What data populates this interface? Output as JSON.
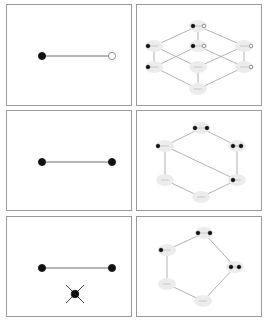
{
  "figure": {
    "rows": [
      {
        "left": {
          "label": "graph-edge-filled-open",
          "edge": {
            "x1": 35,
            "y1": 51,
            "x2": 105,
            "y2": 51
          },
          "nodes": [
            {
              "x": 35,
              "y": 51,
              "fill": "filled"
            },
            {
              "x": 105,
              "y": 51,
              "fill": "open"
            }
          ],
          "cross": null
        },
        "right": {
          "label": "lattice-8-nodes",
          "nodes": [
            {
              "id": "top",
              "x": 61,
              "y": 21,
              "dots": [
                {
                  "dx": -5,
                  "f": "filled"
                },
                {
                  "dx": 6,
                  "f": "open"
                }
              ]
            },
            {
              "id": "ml",
              "x": 17,
              "y": 41,
              "dots": [
                {
                  "dx": -6,
                  "f": "filled"
                }
              ]
            },
            {
              "id": "mc",
              "x": 61,
              "y": 41,
              "dots": [
                {
                  "dx": -5,
                  "f": "filled"
                },
                {
                  "dx": 6,
                  "f": "open"
                }
              ]
            },
            {
              "id": "mr",
              "x": 107,
              "y": 41,
              "dots": [
                {
                  "dx": 7,
                  "f": "open"
                }
              ]
            },
            {
              "id": "ll",
              "x": 17,
              "y": 62,
              "dots": [
                {
                  "dx": -6,
                  "f": "filled"
                }
              ]
            },
            {
              "id": "lc",
              "x": 61,
              "y": 62,
              "dots": []
            },
            {
              "id": "lr",
              "x": 107,
              "y": 62,
              "dots": [
                {
                  "dx": 7,
                  "f": "open"
                }
              ]
            },
            {
              "id": "bot",
              "x": 61,
              "y": 84,
              "dots": []
            }
          ],
          "edges": [
            [
              "top",
              "ml"
            ],
            [
              "top",
              "mc"
            ],
            [
              "top",
              "mr"
            ],
            [
              "ml",
              "ll"
            ],
            [
              "ml",
              "lc"
            ],
            [
              "mc",
              "ll"
            ],
            [
              "mc",
              "lr"
            ],
            [
              "mr",
              "lc"
            ],
            [
              "mr",
              "lr"
            ],
            [
              "ll",
              "bot"
            ],
            [
              "lc",
              "bot"
            ],
            [
              "lr",
              "bot"
            ]
          ]
        }
      },
      {
        "left": {
          "label": "graph-edge-filled-filled",
          "edge": {
            "x1": 35,
            "y1": 51,
            "x2": 105,
            "y2": 51
          },
          "nodes": [
            {
              "x": 35,
              "y": 51,
              "fill": "filled"
            },
            {
              "x": 105,
              "y": 51,
              "fill": "filled"
            }
          ],
          "cross": null
        },
        "right": {
          "label": "hexagon-6-nodes",
          "nodes": [
            {
              "id": "top",
              "x": 64,
              "y": 17,
              "dots": [
                {
                  "dx": -6,
                  "f": "filled"
                },
                {
                  "dx": 6,
                  "f": "filled"
                }
              ]
            },
            {
              "id": "ul",
              "x": 28,
              "y": 35,
              "dots": [
                {
                  "dx": -7,
                  "f": "filled"
                }
              ]
            },
            {
              "id": "ur",
              "x": 100,
              "y": 35,
              "dots": [
                {
                  "dx": -4,
                  "f": "filled"
                },
                {
                  "dx": 4,
                  "f": "filled"
                }
              ]
            },
            {
              "id": "ll",
              "x": 28,
              "y": 69,
              "dots": []
            },
            {
              "id": "lr",
              "x": 100,
              "y": 69,
              "dots": [
                {
                  "dx": -4,
                  "f": "filled"
                }
              ]
            },
            {
              "id": "bot",
              "x": 64,
              "y": 86,
              "dots": []
            }
          ],
          "edges": [
            [
              "top",
              "ul"
            ],
            [
              "top",
              "ur"
            ],
            [
              "ul",
              "ll"
            ],
            [
              "ur",
              "lr"
            ],
            [
              "ll",
              "bot"
            ],
            [
              "lr",
              "bot"
            ],
            [
              "ul",
              "lr"
            ]
          ]
        }
      },
      {
        "left": {
          "label": "graph-edge-with-cross",
          "edge": {
            "x1": 35,
            "y1": 51,
            "x2": 105,
            "y2": 51
          },
          "nodes": [
            {
              "x": 35,
              "y": 51,
              "fill": "filled"
            },
            {
              "x": 105,
              "y": 51,
              "fill": "filled"
            }
          ],
          "cross": {
            "x": 68,
            "y": 77,
            "r": 9
          }
        },
        "right": {
          "label": "pentagon-5-nodes",
          "nodes": [
            {
              "id": "top",
              "x": 67,
              "y": 16,
              "dots": [
                {
                  "dx": -6,
                  "f": "filled"
                },
                {
                  "dx": 6,
                  "f": "filled"
                }
              ]
            },
            {
              "id": "ul",
              "x": 30,
              "y": 33,
              "dots": [
                {
                  "dx": -6,
                  "f": "filled"
                }
              ]
            },
            {
              "id": "r",
              "x": 98,
              "y": 50,
              "dots": [
                {
                  "dx": -4,
                  "f": "filled"
                },
                {
                  "dx": 4,
                  "f": "filled"
                }
              ]
            },
            {
              "id": "ll",
              "x": 30,
              "y": 67,
              "dots": []
            },
            {
              "id": "bot",
              "x": 66,
              "y": 84,
              "dots": []
            }
          ],
          "edges": [
            [
              "top",
              "ul"
            ],
            [
              "top",
              "r"
            ],
            [
              "ul",
              "ll"
            ],
            [
              "ll",
              "bot"
            ],
            [
              "r",
              "bot"
            ]
          ]
        }
      }
    ],
    "colors": {
      "border": "#9a9a9a",
      "edge": "#9e9e9e",
      "node_fill": "#111111",
      "label_bg": "#ececec",
      "label_line": "#b8b8b8"
    }
  }
}
